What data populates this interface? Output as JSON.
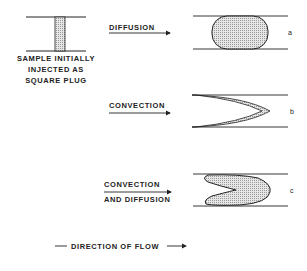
{
  "sample": {
    "caption_lines": [
      "SAMPLE INITIALLY",
      "INJECTED AS",
      "SQUARE PLUG"
    ]
  },
  "panels": [
    {
      "id": "a",
      "arrow_label_lines": [
        "DIFFUSION"
      ],
      "tag": "a",
      "shape": "rounded-plug"
    },
    {
      "id": "b",
      "arrow_label_lines": [
        "CONVECTION"
      ],
      "tag": "b",
      "shape": "parabolic-front"
    },
    {
      "id": "c",
      "arrow_label_lines": [
        "CONVECTION",
        "AND DIFFUSION"
      ],
      "tag": "c",
      "shape": "diffuse-parabolic-band"
    }
  ],
  "footer": {
    "direction_label": "DIRECTION OF FLOW"
  },
  "colors": {
    "line": "#222222",
    "fill": "#d8d8d8"
  }
}
